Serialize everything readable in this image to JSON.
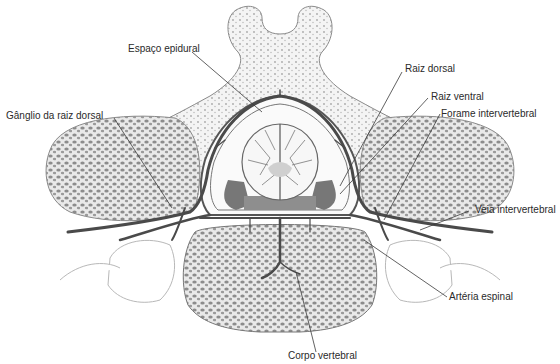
{
  "labels": {
    "espaco_epidural": "Espaço epidural",
    "ganglio": "Gânglio da raiz dorsal",
    "raiz_dorsal": "Raiz dorsal",
    "raiz_ventral": "Raiz ventral",
    "forame": "Forame intervertebral",
    "veia": "Veia intervertebral",
    "arteria": "Artéria espinal",
    "corpo": "Corpo vertebral"
  },
  "colors": {
    "outline": "#8a8a8a",
    "bone_fill": "#f2f2f2",
    "vessel": "#4a4a4a",
    "leader": "#3a3a3a",
    "cord": "#f7f7f7",
    "dark_tissue": "#6e6e6e"
  }
}
